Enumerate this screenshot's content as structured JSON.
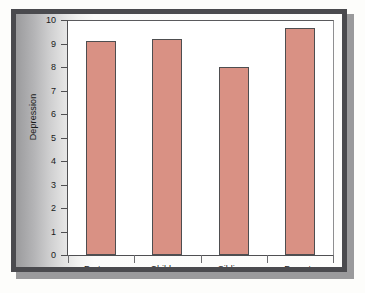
{
  "chart_data": {
    "type": "bar",
    "title": "",
    "subtitle": "",
    "xlabel": "",
    "ylabel": "Depression",
    "categories": [
      "Partners",
      "Children",
      "Siblings",
      "Parents"
    ],
    "values": [
      9.1,
      9.2,
      8.0,
      9.65
    ],
    "series": [
      {
        "name": "Depression",
        "values": [
          9.1,
          9.2,
          8.0,
          9.65
        ]
      }
    ],
    "ylim": [
      0,
      10
    ],
    "ytick_labels": [
      "10",
      "9",
      "8",
      "7",
      "6",
      "5",
      "4",
      "3",
      "2",
      "1",
      "0"
    ],
    "ytick_values": [
      10,
      9,
      8,
      7,
      6,
      5,
      4,
      3,
      2,
      1,
      0
    ],
    "grid": false,
    "legend": false,
    "legend_position": "none",
    "bar_color": "#d99184",
    "bar_edge_color": "#4e4e50",
    "plot_background": "#ffffff",
    "frame_color": "#4a4a4e",
    "axis_color": "#4f4f52",
    "text_color": "#1a1a1a"
  }
}
